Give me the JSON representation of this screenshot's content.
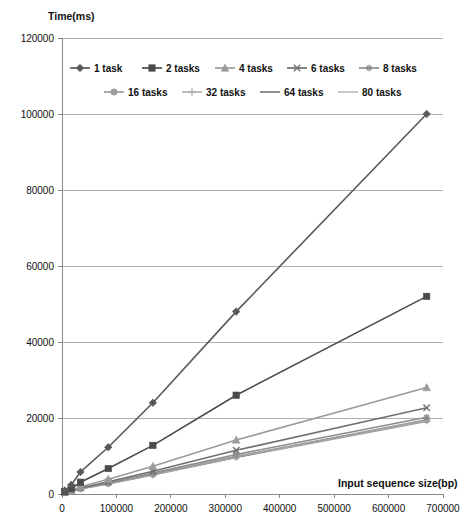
{
  "chart_data": {
    "type": "line",
    "title": "",
    "xlabel": "Input sequence size(bp)",
    "ylabel": "Time(ms)",
    "xlim": [
      0,
      700000
    ],
    "ylim": [
      0,
      120000
    ],
    "xticks": [
      0,
      100000,
      200000,
      300000,
      400000,
      500000,
      600000,
      700000
    ],
    "yticks": [
      0,
      20000,
      40000,
      60000,
      80000,
      100000,
      120000
    ],
    "xtick_labels": [
      "0",
      "100000",
      "200000",
      "300000",
      "400000",
      "500000",
      "600000",
      "700000"
    ],
    "ytick_labels": [
      "0",
      "20000",
      "40000",
      "60000",
      "80000",
      "100000",
      "120000"
    ],
    "grid": "horizontal",
    "legend_position": "top-inside",
    "series": [
      {
        "name": "1 task",
        "marker": "diamond",
        "color": "#595959",
        "x": [
          5000,
          17000,
          34000,
          85000,
          167000,
          320000,
          670000
        ],
        "values": [
          900,
          2400,
          5800,
          12300,
          24000,
          48000,
          100000
        ]
      },
      {
        "name": "2 tasks",
        "marker": "square",
        "color": "#4a4a4a",
        "x": [
          5000,
          17000,
          34000,
          85000,
          167000,
          320000,
          670000
        ],
        "values": [
          600,
          1400,
          3100,
          6700,
          12800,
          26000,
          52000
        ]
      },
      {
        "name": "4 tasks",
        "marker": "triangle",
        "color": "#9a9a9a",
        "x": [
          5000,
          17000,
          34000,
          85000,
          167000,
          320000,
          670000
        ],
        "values": [
          500,
          1000,
          1900,
          3900,
          7300,
          14200,
          28000
        ]
      },
      {
        "name": "6 tasks",
        "marker": "cross",
        "color": "#707070",
        "x": [
          5000,
          17000,
          34000,
          85000,
          167000,
          320000,
          670000
        ],
        "values": [
          450,
          900,
          1600,
          3200,
          6000,
          11500,
          22700
        ]
      },
      {
        "name": "8 tasks",
        "marker": "star",
        "color": "#8c8c8c",
        "x": [
          5000,
          17000,
          34000,
          85000,
          167000,
          320000,
          670000
        ],
        "values": [
          420,
          850,
          1500,
          2900,
          5500,
          10400,
          20200
        ]
      },
      {
        "name": "16 tasks",
        "marker": "circle",
        "color": "#9e9e9e",
        "x": [
          5000,
          17000,
          34000,
          85000,
          167000,
          320000,
          670000
        ],
        "values": [
          400,
          800,
          1450,
          2800,
          5200,
          9900,
          19500
        ]
      },
      {
        "name": "32 tasks",
        "marker": "plus",
        "color": "#b3b3b3",
        "x": [
          5000,
          17000,
          34000,
          85000,
          167000,
          320000,
          670000
        ],
        "values": [
          400,
          800,
          1400,
          2750,
          5100,
          9800,
          19300
        ]
      },
      {
        "name": "64 tasks",
        "marker": "none",
        "color": "#7d7d7d",
        "x": [
          5000,
          17000,
          34000,
          85000,
          167000,
          320000,
          670000
        ],
        "values": [
          380,
          780,
          1380,
          2700,
          5050,
          9700,
          19200
        ]
      },
      {
        "name": "80 tasks",
        "marker": "none",
        "color": "#c0c0c0",
        "x": [
          5000,
          17000,
          34000,
          85000,
          167000,
          320000,
          670000
        ],
        "values": [
          370,
          760,
          1350,
          2650,
          5000,
          9600,
          19100
        ]
      }
    ]
  },
  "legend": {
    "rows": [
      [
        "1 task",
        "2 tasks",
        "4 tasks",
        "6 tasks",
        "8 tasks"
      ],
      [
        "16 tasks",
        "32 tasks",
        "64 tasks",
        "80 tasks"
      ]
    ]
  },
  "colors": {
    "grid": "#b0b0b0",
    "axis": "#8a8a8a",
    "text": "#111111",
    "background": "#ffffff"
  }
}
